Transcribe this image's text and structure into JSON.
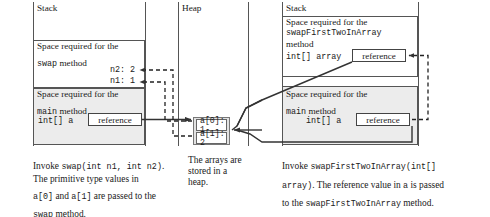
{
  "figure": {
    "panels": {
      "stack_left": {
        "title": "Stack"
      },
      "heap": {
        "title": "Heap"
      },
      "stack_right": {
        "title": "Stack"
      }
    }
  },
  "left_stack": {
    "swap_frame": {
      "line1": "Space required for the",
      "line2_mono": "swap",
      "line2_rest": " method",
      "var_n2": "n2: 2",
      "var_n1": "n1: 1"
    },
    "main_frame": {
      "line1": "Space required for the",
      "line2_mono": "main",
      "line2_rest": " method",
      "var_decl": "int[] a",
      "ref_cell": "reference"
    }
  },
  "heap_panel": {
    "array": {
      "cell0": "a[0]: 1",
      "cell1": "a[1]: 2"
    }
  },
  "right_stack": {
    "swapfirst_frame": {
      "line1": "Space required for the",
      "line2_mono": "swapFirstTwoInArray",
      "line3": "method",
      "var_decl": "int[] array",
      "ref_cell": "reference"
    },
    "main_frame": {
      "line1": "Space required for the",
      "line2_mono": "main",
      "line2_rest": " method",
      "var_decl": "int[] a",
      "ref_cell": "reference"
    }
  },
  "captions": {
    "left": {
      "l1_a": "Invoke ",
      "l1_mono": "swap(int n1, int n2)",
      "l1_b": ".",
      "l2": "The primitive type values in",
      "l3_mono_a": "a[0]",
      "l3_mid": " and ",
      "l3_mono_b": "a[1]",
      "l3_end": " are passed to the",
      "l4_mono": "swap",
      "l4_end": " method."
    },
    "middle": {
      "l1": "The arrays are",
      "l2": "stored in a",
      "l3": "heap."
    },
    "right": {
      "l1_a": "Invoke ",
      "l1_mono": "swapFirstTwoInArray(int[]",
      "l2_mono": "array)",
      "l2_rest": ". The reference value in ",
      "l2_mono_b": "a",
      "l2_end": " is passed",
      "l3_a": "to the ",
      "l3_mono": "swapFirstTwoInArray",
      "l3_end": " method."
    }
  },
  "colors": {
    "line": "#555555",
    "frame_border": "#555555",
    "shade": "#ececec",
    "heap_shade": "#e2e2e2",
    "text": "#1a1a1a"
  }
}
